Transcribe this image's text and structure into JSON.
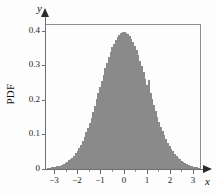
{
  "figure": {
    "background": "#fdfdfd",
    "frame_color": "#8d8d8d",
    "bar_fill": "#c9c9c9",
    "bar_edge": "#8a8a8a"
  },
  "axis_titles": {
    "y_axis_symbol": "y",
    "x_axis_symbol": "x",
    "y_axis_name": "PDF"
  },
  "chart_data": {
    "type": "bar",
    "title": "",
    "subtitle": "",
    "xlabel": "x",
    "ylabel": "PDF",
    "grid": false,
    "legend": null,
    "xlim": [
      -3.35,
      3.35
    ],
    "ylim": [
      0,
      0.42
    ],
    "xticks": [
      -3,
      -2,
      -1,
      0,
      1,
      2,
      3
    ],
    "xticklabels": [
      "−3",
      "−2",
      "−1",
      "0",
      "1",
      "2",
      "3"
    ],
    "yticks": [
      0,
      0.1,
      0.2,
      0.3,
      0.4
    ],
    "yticklabels": [
      "0",
      "0.1",
      "0.2",
      "0.3",
      "0.4"
    ],
    "bin_width": 0.075,
    "x": [
      -3.2625,
      -3.1875,
      -3.1125,
      -3.0375,
      -2.9625,
      -2.8875,
      -2.8125,
      -2.7375,
      -2.6625,
      -2.5875,
      -2.5125,
      -2.4375,
      -2.3625,
      -2.2875,
      -2.2125,
      -2.1375,
      -2.0625,
      -1.9875,
      -1.9125,
      -1.8375,
      -1.7625,
      -1.6875,
      -1.6125,
      -1.5375,
      -1.4625,
      -1.3875,
      -1.3125,
      -1.2375,
      -1.1625,
      -1.0875,
      -1.0125,
      -0.9375,
      -0.8625,
      -0.7875,
      -0.7125,
      -0.6375,
      -0.5625,
      -0.4875,
      -0.4125,
      -0.3375,
      -0.2625,
      -0.1875,
      -0.1125,
      -0.0375,
      0.0375,
      0.1125,
      0.1875,
      0.2625,
      0.3375,
      0.4125,
      0.4875,
      0.5625,
      0.6375,
      0.7125,
      0.7875,
      0.8625,
      0.9375,
      1.0125,
      1.0875,
      1.1625,
      1.2375,
      1.3125,
      1.3875,
      1.4625,
      1.5375,
      1.6125,
      1.6875,
      1.7625,
      1.8375,
      1.9125,
      1.9875,
      2.0625,
      2.1375,
      2.2125,
      2.2875,
      2.3625,
      2.4375,
      2.5125,
      2.5875,
      2.6625,
      2.7375,
      2.8125,
      2.8875,
      2.9625,
      3.0375,
      3.1125,
      3.1875,
      3.2625
    ],
    "values": [
      0.004,
      0.003,
      0.005,
      0.006,
      0.006,
      0.008,
      0.01,
      0.01,
      0.013,
      0.015,
      0.018,
      0.021,
      0.025,
      0.028,
      0.033,
      0.039,
      0.047,
      0.053,
      0.062,
      0.07,
      0.082,
      0.093,
      0.106,
      0.119,
      0.134,
      0.148,
      0.165,
      0.183,
      0.202,
      0.219,
      0.238,
      0.256,
      0.273,
      0.292,
      0.308,
      0.324,
      0.34,
      0.352,
      0.363,
      0.374,
      0.383,
      0.389,
      0.393,
      0.396,
      0.397,
      0.394,
      0.391,
      0.385,
      0.377,
      0.368,
      0.357,
      0.344,
      0.329,
      0.314,
      0.298,
      0.28,
      0.262,
      0.244,
      0.258,
      0.22,
      0.203,
      0.186,
      0.168,
      0.152,
      0.137,
      0.123,
      0.11,
      0.098,
      0.086,
      0.076,
      0.067,
      0.058,
      0.051,
      0.044,
      0.038,
      0.032,
      0.028,
      0.024,
      0.02,
      0.017,
      0.014,
      0.012,
      0.01,
      0.008,
      0.007,
      0.006,
      0.005,
      0.004
    ]
  }
}
